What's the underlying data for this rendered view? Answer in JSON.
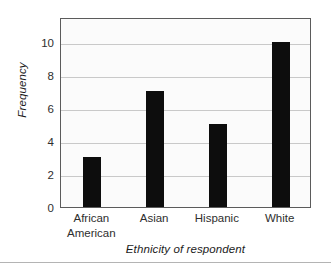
{
  "chart_data": {
    "type": "bar",
    "title": "",
    "subtitle": "",
    "categories": [
      "African American",
      "Asian",
      "Hispanic",
      "White"
    ],
    "category_lines": [
      [
        "African",
        "American"
      ],
      [
        "Asian"
      ],
      [
        "Hispanic"
      ],
      [
        "White"
      ]
    ],
    "values": [
      3,
      7,
      5,
      10
    ],
    "series": [
      {
        "name": "Frequency",
        "values": [
          3,
          7,
          5,
          10
        ]
      }
    ],
    "xlabel": "Ethnicity of respondent",
    "ylabel": "Frequency",
    "ylim": [
      0,
      11.5
    ],
    "xlim": [
      0,
      4
    ],
    "yticks": [
      0,
      2,
      4,
      6,
      8,
      10
    ],
    "ytick_labels": [
      "0",
      "2",
      "4",
      "6",
      "8",
      "10"
    ],
    "gridlines": {
      "horizontal": true,
      "vertical": false,
      "values": [
        2,
        4,
        6,
        8,
        10
      ]
    },
    "legend": {
      "visible": false,
      "position": "none"
    },
    "colors": {
      "bar": "#0d0d0d",
      "plot_background": "#fbfbfb",
      "plot_border": "#5b5b5b",
      "gridline": "#c9c9c9",
      "text": "#2e2e2e",
      "footer_rule": "#b4b4b4"
    }
  }
}
